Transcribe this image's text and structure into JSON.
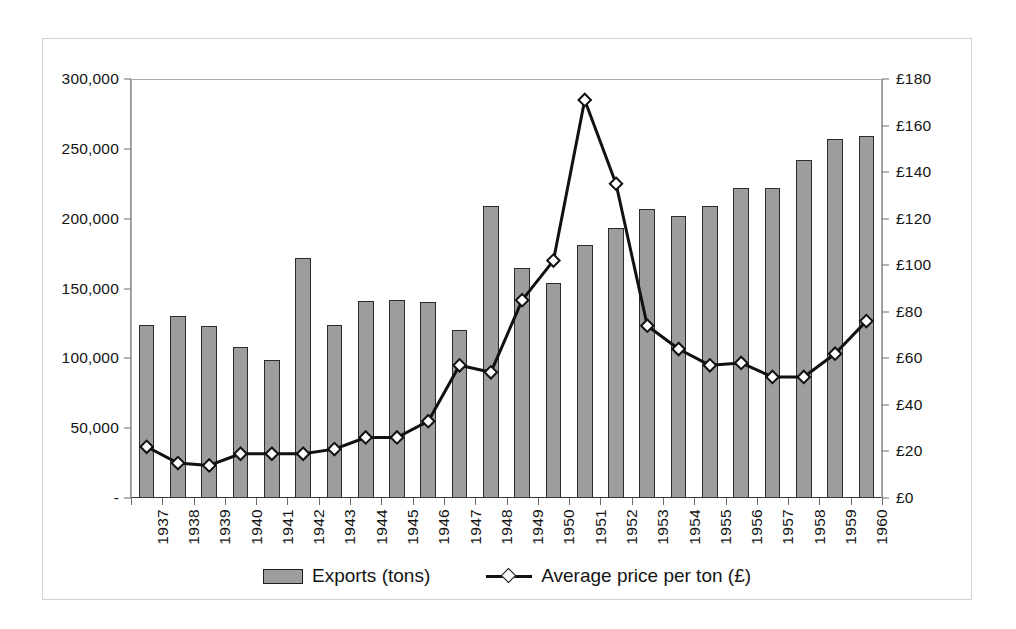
{
  "chart_data": {
    "type": "bar",
    "title": "",
    "subtitle": "",
    "xlabel": "",
    "ylabel": "",
    "categories": [
      "1937",
      "1938",
      "1939",
      "1940",
      "1941",
      "1942",
      "1943",
      "1944",
      "1945",
      "1946",
      "1947",
      "1948",
      "1949",
      "1950",
      "1951",
      "1952",
      "1953",
      "1954",
      "1955",
      "1956",
      "1957",
      "1958",
      "1959",
      "1960"
    ],
    "grid": false,
    "legend_position": "bottom",
    "series": [
      {
        "name": "Exports (tons)",
        "type": "bar",
        "axis": "left",
        "color": "#9d9d9d",
        "border_color": "#2b2b2b",
        "values": [
          124000,
          130000,
          123000,
          108000,
          99000,
          172000,
          124000,
          141000,
          142000,
          140000,
          120000,
          209000,
          165000,
          154000,
          181000,
          193000,
          207000,
          202000,
          209000,
          222000,
          222000,
          242000,
          257000,
          259000
        ]
      },
      {
        "name": "Average price per ton (£)",
        "type": "line",
        "axis": "right",
        "color": "#111111",
        "marker": "diamond",
        "values": [
          22,
          15,
          14,
          19,
          19,
          19,
          21,
          26,
          26,
          33,
          57,
          54,
          85,
          102,
          171,
          135,
          74,
          64,
          57,
          58,
          52,
          52,
          62,
          76
        ]
      }
    ],
    "y_axis_left": {
      "label": "",
      "min": 0,
      "max": 300000,
      "step": 50000,
      "tick_labels": [
        "300,000",
        "250,000",
        "200,000",
        "150,000",
        "100,000",
        "50,000",
        "-"
      ],
      "tick_values": [
        300000,
        250000,
        200000,
        150000,
        100000,
        50000,
        0
      ]
    },
    "y_axis_right": {
      "label": "",
      "min": 0,
      "max": 180,
      "step": 20,
      "tick_labels": [
        "£180",
        "£160",
        "£140",
        "£120",
        "£100",
        "£80",
        "£60",
        "£40",
        "£20",
        "£0"
      ],
      "tick_values": [
        180,
        160,
        140,
        120,
        100,
        80,
        60,
        40,
        20,
        0
      ]
    },
    "legend": [
      {
        "label": "Exports (tons)",
        "marker": "bar-swatch"
      },
      {
        "label": "Average price per ton (£)",
        "marker": "line-diamond-swatch"
      }
    ]
  },
  "colors": {
    "bar_fill": "#9d9d9d",
    "bar_border": "#2b2b2b",
    "line": "#111111",
    "marker_fill": "#ffffff",
    "axis": "#6d6d6d",
    "frame": "#d2d2d2",
    "text": "#141414",
    "background": "#ffffff"
  }
}
